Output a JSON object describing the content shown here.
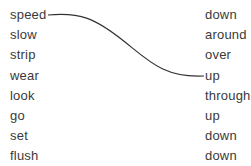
{
  "left_words": [
    "speed",
    "slow",
    "strip",
    "wear",
    "look",
    "go",
    "set",
    "flush"
  ],
  "right_words": [
    "down",
    "around",
    "over",
    "up",
    "through",
    "up",
    "down",
    "down"
  ],
  "connections": [
    {
      "from": "speed",
      "from_index": 0,
      "to": "up",
      "to_index": 3
    }
  ],
  "line_color": "#333333"
}
